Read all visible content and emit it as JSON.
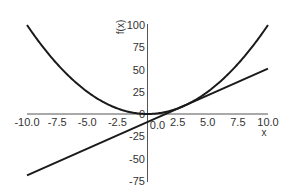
{
  "chart_data": {
    "type": "line",
    "title": "",
    "xlabel": "x",
    "ylabel": "f(x)",
    "xlim": [
      -10,
      10
    ],
    "ylim": [
      -75,
      100
    ],
    "grid": false,
    "legend": null,
    "x_ticks": [
      "-10.0",
      "-7.5",
      "-5.0",
      "-2.5",
      "0.0",
      "2.5",
      "5.0",
      "7.5",
      "10.0"
    ],
    "y_ticks": [
      "100",
      "75",
      "50",
      "25",
      "0",
      "-25",
      "-50",
      "-75"
    ],
    "series": [
      {
        "name": "f(x) = x^2",
        "kind": "curve",
        "x": [
          -10,
          -7.5,
          -5,
          -2.5,
          0,
          2.5,
          5,
          7.5,
          10
        ],
        "y": [
          100,
          56.25,
          25,
          6.25,
          0,
          6.25,
          25,
          56.25,
          100
        ]
      },
      {
        "name": "tangent line at x = 3 (y = 6x - 9)",
        "kind": "line",
        "x": [
          -10,
          10
        ],
        "y": [
          -69,
          51
        ]
      }
    ],
    "annotations": []
  },
  "colors": {
    "curve": "#1a1a1a",
    "axis": "#555555",
    "text": "#333333"
  }
}
